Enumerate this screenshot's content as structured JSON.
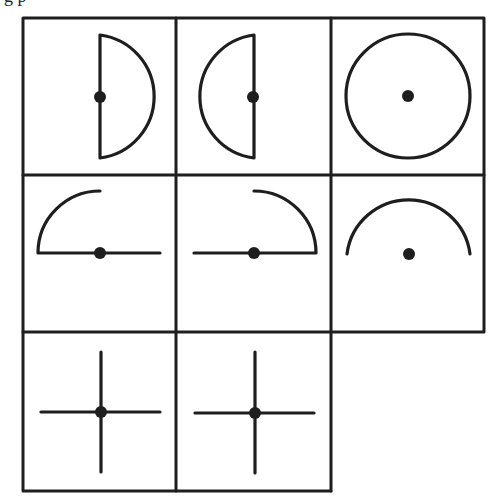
{
  "header": {
    "cutoff_text": "g p"
  },
  "figure": {
    "colors": {
      "ink": "#1e1e1e",
      "background": "#ffffff"
    },
    "cells": [
      {
        "row": 1,
        "col": 1,
        "shape": "right-half-circle-with-dot-on-diameter"
      },
      {
        "row": 1,
        "col": 2,
        "shape": "left-half-circle-with-dot-on-diameter"
      },
      {
        "row": 1,
        "col": 3,
        "shape": "full-circle-with-center-dot"
      },
      {
        "row": 2,
        "col": 1,
        "shape": "upper-left-quarter-arc-with-horizontal-diameter-and-dot"
      },
      {
        "row": 2,
        "col": 2,
        "shape": "upper-right-quarter-arc-with-horizontal-diameter-and-dot"
      },
      {
        "row": 2,
        "col": 3,
        "shape": "upper-semicircle-arc-with-center-dot"
      },
      {
        "row": 3,
        "col": 1,
        "shape": "cross-with-center-dot"
      },
      {
        "row": 3,
        "col": 2,
        "shape": "cross-with-center-dot"
      },
      {
        "row": 3,
        "col": 3,
        "shape": "empty"
      }
    ]
  }
}
